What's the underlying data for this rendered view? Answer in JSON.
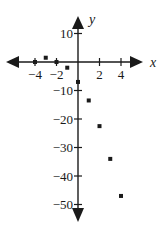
{
  "chart_data": {
    "type": "scatter",
    "title": "",
    "xlabel": "x",
    "ylabel": "y",
    "x": [
      -4,
      -3,
      -2,
      -1,
      0,
      1,
      2,
      3,
      4
    ],
    "y": [
      0,
      1.5,
      0,
      -2,
      -7,
      -13.5,
      -22.5,
      -34,
      -47
    ],
    "xticks": [
      -4,
      -2,
      2,
      4
    ],
    "xtick_labels": [
      "−4",
      "−2",
      "2",
      "4"
    ],
    "yticks": [
      10,
      -10,
      -20,
      -30,
      -40,
      -50
    ],
    "ytick_labels": [
      "10",
      "−10",
      "−20",
      "−30",
      "−40",
      "−50"
    ],
    "xlim": [
      -5.5,
      5.5
    ],
    "ylim": [
      -55,
      15
    ],
    "grid": false,
    "legend": null,
    "marker_color": "#1a1a1a"
  },
  "axes": {
    "x_name": "x",
    "y_name": "y"
  }
}
